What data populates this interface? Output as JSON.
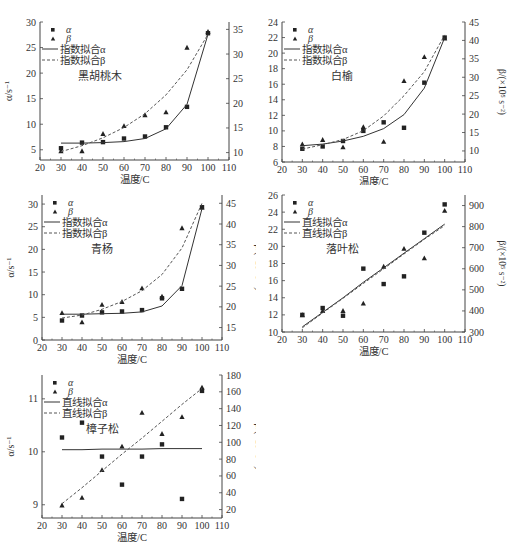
{
  "figure": {
    "xlabel": "温度/C",
    "ylabel_left": "α/s⁻¹",
    "ylabel_right": "β/(×10⁵ s⁻²)"
  },
  "chart_data": [
    {
      "id": "black-walnut",
      "type": "scatter",
      "title": "黑胡桃木",
      "xlabel": "温度/C",
      "ylabel": "α/s⁻¹",
      "ylabel_right": "β/(×10⁵ s⁻²)",
      "xlim": [
        20,
        110
      ],
      "xticks": [
        20,
        30,
        40,
        50,
        60,
        70,
        80,
        90,
        100,
        110
      ],
      "ylim": [
        3,
        30
      ],
      "yticks": [
        5,
        10,
        15,
        20,
        25,
        30
      ],
      "ylim_right": [
        8.5,
        36.5
      ],
      "yticks_right": [
        10,
        15,
        20,
        25,
        30,
        35
      ],
      "legend": [
        "α",
        "β",
        "指数拟合α",
        "指数拟合β"
      ],
      "grid": false,
      "x": [
        30,
        40,
        50,
        60,
        70,
        80,
        90,
        100
      ],
      "series": [
        {
          "name": "α",
          "marker": "square",
          "axis": "left",
          "values": [
            5.3,
            6.4,
            6.5,
            7.2,
            7.6,
            9.4,
            13.4,
            27.8
          ]
        },
        {
          "name": "β",
          "marker": "triangle",
          "axis": "right",
          "values": [
            10.3,
            10.3,
            13.8,
            15.4,
            17.6,
            18.2,
            31.3,
            34.5
          ]
        },
        {
          "name": "指数拟合α",
          "style": "solid",
          "axis": "left",
          "values": [
            6.3,
            6.3,
            6.4,
            6.6,
            7.2,
            9.1,
            13.9,
            27.6
          ]
        },
        {
          "name": "指数拟合β",
          "style": "dashed",
          "axis": "right",
          "values": [
            10.2,
            11.4,
            13.0,
            15.1,
            17.9,
            21.7,
            26.8,
            34.0
          ]
        }
      ]
    },
    {
      "id": "white-elm",
      "type": "scatter",
      "title": "白榆",
      "xlabel": "温度/C",
      "ylabel": "α/s⁻¹",
      "ylabel_right": "β/(×10⁵ s⁻²)",
      "xlim": [
        20,
        110
      ],
      "xticks": [
        20,
        30,
        40,
        50,
        60,
        70,
        80,
        90,
        100,
        110
      ],
      "ylim": [
        6,
        24
      ],
      "yticks": [
        6,
        8,
        10,
        12,
        14,
        16,
        18,
        20,
        22,
        24
      ],
      "ylim_right": [
        7,
        45
      ],
      "yticks_right": [
        10,
        15,
        20,
        25,
        30,
        35,
        40,
        45
      ],
      "legend": [
        "α",
        "β",
        "指数拟合α",
        "指数拟合β"
      ],
      "grid": false,
      "x": [
        30,
        40,
        50,
        60,
        70,
        80,
        90,
        100
      ],
      "series": [
        {
          "name": "α",
          "marker": "square",
          "axis": "left",
          "values": [
            7.7,
            8.0,
            8.7,
            10.0,
            11.1,
            10.4,
            16.2,
            22.0
          ]
        },
        {
          "name": "β",
          "marker": "triangle",
          "axis": "right",
          "values": [
            11.8,
            13.0,
            11.0,
            16.5,
            12.5,
            29.0,
            35.5,
            40.5
          ]
        },
        {
          "name": "指数拟合α",
          "style": "solid",
          "axis": "left",
          "values": [
            8.1,
            8.3,
            8.7,
            9.3,
            10.3,
            12.1,
            15.5,
            22.0
          ]
        },
        {
          "name": "指数拟合β",
          "style": "dashed",
          "axis": "right",
          "values": [
            10.5,
            11.7,
            13.1,
            15.5,
            19.5,
            25.0,
            31.5,
            41.5
          ]
        }
      ]
    },
    {
      "id": "green-poplar",
      "type": "scatter",
      "title": "青杨",
      "xlabel": "温度/C",
      "ylabel": "α/s⁻¹",
      "ylabel_right": "β/(×10⁵ s⁻²)",
      "xlim": [
        20,
        110
      ],
      "xticks": [
        20,
        30,
        40,
        50,
        60,
        70,
        80,
        90,
        100,
        110
      ],
      "ylim": [
        0,
        32
      ],
      "yticks": [
        0,
        5,
        10,
        15,
        20,
        25,
        30
      ],
      "ylim_right": [
        12,
        47
      ],
      "yticks_right": [
        15,
        20,
        25,
        30,
        35,
        40,
        45
      ],
      "legend": [
        "α",
        "β",
        "指数拟合α",
        "指数拟合β"
      ],
      "grid": false,
      "x": [
        30,
        40,
        50,
        60,
        70,
        80,
        90,
        100
      ],
      "series": [
        {
          "name": "α",
          "marker": "square",
          "axis": "left",
          "values": [
            4.3,
            5.4,
            6.1,
            6.3,
            6.6,
            9.2,
            11.3,
            29.3
          ]
        },
        {
          "name": "β",
          "marker": "triangle",
          "axis": "right",
          "values": [
            18.5,
            16.3,
            20.5,
            21.2,
            24.5,
            22.5,
            39.0,
            44.0
          ]
        },
        {
          "name": "指数拟合α",
          "style": "solid",
          "axis": "left",
          "values": [
            5.7,
            5.7,
            5.8,
            5.9,
            6.2,
            7.5,
            12.0,
            29.0
          ]
        },
        {
          "name": "指数拟合β",
          "style": "dashed",
          "axis": "right",
          "values": [
            17.3,
            18.0,
            19.4,
            21.3,
            23.9,
            27.8,
            34.2,
            45.0
          ]
        }
      ]
    },
    {
      "id": "larch",
      "type": "scatter",
      "title": "落叶松",
      "xlabel": "温度/C",
      "ylabel": "α/s⁻¹",
      "ylabel_right": "β/(×10⁵ s⁻²)",
      "xlim": [
        20,
        110
      ],
      "xticks": [
        20,
        30,
        40,
        50,
        60,
        70,
        80,
        90,
        100,
        110
      ],
      "ylim": [
        10,
        26
      ],
      "yticks": [
        10,
        12,
        14,
        16,
        18,
        20,
        22,
        24,
        26
      ],
      "ylim_right": [
        300,
        950
      ],
      "yticks_right": [
        300,
        400,
        500,
        600,
        700,
        800,
        900
      ],
      "legend": [
        "α",
        "β",
        "直线拟合α",
        "直线拟合β"
      ],
      "grid": false,
      "x": [
        30,
        40,
        50,
        60,
        70,
        80,
        90,
        100
      ],
      "series": [
        {
          "name": "α",
          "marker": "square",
          "axis": "left",
          "values": [
            12.0,
            12.8,
            11.9,
            17.4,
            15.6,
            16.5,
            21.6,
            24.9
          ]
        },
        {
          "name": "β",
          "marker": "triangle",
          "axis": "right",
          "values": [
            380,
            400,
            400,
            435,
            610,
            695,
            650,
            875
          ]
        },
        {
          "name": "直线拟合α",
          "style": "solid",
          "axis": "left",
          "values": [
            10.6,
            12.3,
            14.0,
            15.8,
            17.5,
            19.2,
            20.9,
            22.6
          ]
        },
        {
          "name": "直线拟合β",
          "style": "dashed",
          "axis": "right",
          "values": [
            320,
            390,
            460,
            530,
            600,
            670,
            740,
            805
          ]
        }
      ]
    },
    {
      "id": "mongolian-pine",
      "type": "scatter",
      "title": "樟子松",
      "xlabel": "温度/C",
      "ylabel": "α/s⁻¹",
      "ylabel_right": "β/(×10⁵ s⁻²)",
      "xlim": [
        20,
        110
      ],
      "xticks": [
        20,
        30,
        40,
        50,
        60,
        70,
        80,
        90,
        100,
        110
      ],
      "ylim": [
        8.75,
        11.45
      ],
      "yticks": [
        9,
        10,
        11
      ],
      "ylim_right": [
        10,
        180
      ],
      "yticks_right": [
        20,
        40,
        60,
        80,
        100,
        120,
        140,
        160,
        180
      ],
      "legend": [
        "α",
        "β",
        "直线拟合α",
        "直线拟合β"
      ],
      "grid": false,
      "x": [
        30,
        40,
        50,
        60,
        70,
        80,
        90,
        100
      ],
      "series": [
        {
          "name": "α",
          "marker": "square",
          "axis": "left",
          "values": [
            10.27,
            10.55,
            9.91,
            9.38,
            9.91,
            10.14,
            9.11,
            11.15
          ]
        },
        {
          "name": "β",
          "marker": "triangle",
          "axis": "right",
          "values": [
            25,
            34,
            67,
            95,
            135,
            110,
            130,
            165
          ]
        },
        {
          "name": "直线拟合α",
          "style": "solid",
          "axis": "left",
          "values": [
            10.04,
            10.04,
            10.05,
            10.05,
            10.05,
            10.06,
            10.06,
            10.06
          ]
        },
        {
          "name": "直线拟合β",
          "style": "dashed",
          "axis": "right",
          "values": [
            27,
            46,
            66,
            86,
            105,
            125,
            145,
            164
          ]
        }
      ]
    }
  ]
}
